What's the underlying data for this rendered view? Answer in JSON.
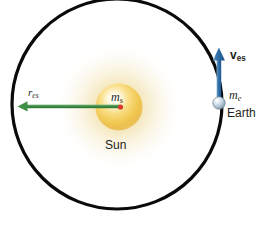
{
  "figure": {
    "background_color": "#ffffff",
    "width": 273,
    "height": 225
  },
  "orbit": {
    "name": "earth-orbit-circle",
    "center_x": 117,
    "center_y": 104,
    "radius": 105,
    "stroke_color": "#000000",
    "stroke_width": 3.2
  },
  "sun": {
    "label": "Sun",
    "mass_symbol": "m",
    "mass_subscript": "s",
    "center_x": 119,
    "center_y": 107,
    "core_radius": 23,
    "glow_radius": 66,
    "core_color": "#f2c442",
    "glow_color": "#e8c86a",
    "center_dot_color": "#d93a2b"
  },
  "earth": {
    "label": "Earth",
    "mass_symbol": "m",
    "mass_subscript": "e",
    "center_x": 219,
    "center_y": 103,
    "radius": 6.2,
    "body_color": "#9fb6ca",
    "highlight_color": "#ffffff"
  },
  "radius_arrow": {
    "symbol": "r",
    "subscript": "es",
    "color": "#3f8f45",
    "from_x": 120,
    "from_y": 107,
    "to_x": 18,
    "to_y": 107,
    "direction": "left"
  },
  "velocity_arrow": {
    "symbol": "v",
    "subscript": "es",
    "color": "#2d6da4",
    "from_x": 219,
    "from_y": 101,
    "to_x": 219,
    "to_y": 48,
    "direction": "up"
  }
}
